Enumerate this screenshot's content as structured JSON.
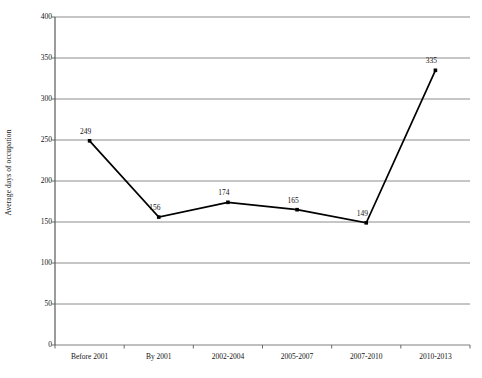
{
  "chart_data": {
    "type": "line",
    "title": "",
    "subtitle": "",
    "xlabel": "",
    "ylabel": "Average days of occupation",
    "categories": [
      "Before 2001",
      "By 2001",
      "2002-2004",
      "2005-2007",
      "2007-2010",
      "2010-2013"
    ],
    "values": [
      249,
      156,
      174,
      165,
      149,
      335
    ],
    "point_labels": [
      "249",
      "156",
      "174",
      "165",
      "149",
      "335"
    ],
    "ylim": [
      0,
      400
    ],
    "yticks": [
      0,
      50,
      100,
      150,
      200,
      250,
      300,
      350,
      400
    ],
    "ytick_labels": [
      "0",
      "50",
      "100",
      "150",
      "200",
      "250",
      "300",
      "350",
      "400"
    ],
    "grid": {
      "horizontal": true,
      "vertical": false,
      "color": "#808080"
    },
    "legend": {
      "visible": false,
      "position": "none",
      "entries": []
    },
    "series": [
      {
        "name": "Average days of occupation",
        "values": [
          249,
          156,
          174,
          165,
          149,
          335
        ],
        "line_color": "#000000",
        "marker": "square",
        "marker_color": "#000000",
        "show_labels": true
      }
    ],
    "colors": {
      "background": "#ffffff",
      "axis": "#595959",
      "gridline": "#808080",
      "line": "#000000",
      "text": "#141414"
    }
  }
}
